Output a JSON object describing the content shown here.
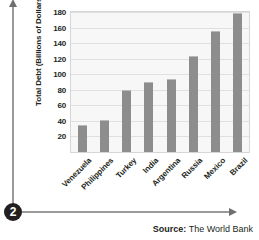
{
  "callout": {
    "number": "2"
  },
  "chart_data": {
    "type": "bar",
    "title": "",
    "xlabel": "",
    "ylabel": "Total Debt (Billions of Dollars)",
    "categories": [
      "Venezuela",
      "Philippines",
      "Turkey",
      "India",
      "Argentina",
      "Russia",
      "Mexico",
      "Brazil"
    ],
    "values": [
      35,
      41,
      80,
      90,
      94,
      124,
      156,
      179
    ],
    "ylim": [
      0,
      180
    ],
    "yticks": [
      20,
      40,
      60,
      80,
      100,
      120,
      140,
      160,
      180
    ],
    "grid": true,
    "legend": false,
    "bar_color": "#8d8d8d",
    "plot_background": "#f7f7f7"
  },
  "source": {
    "label": "Source:",
    "text": " The World Bank"
  }
}
